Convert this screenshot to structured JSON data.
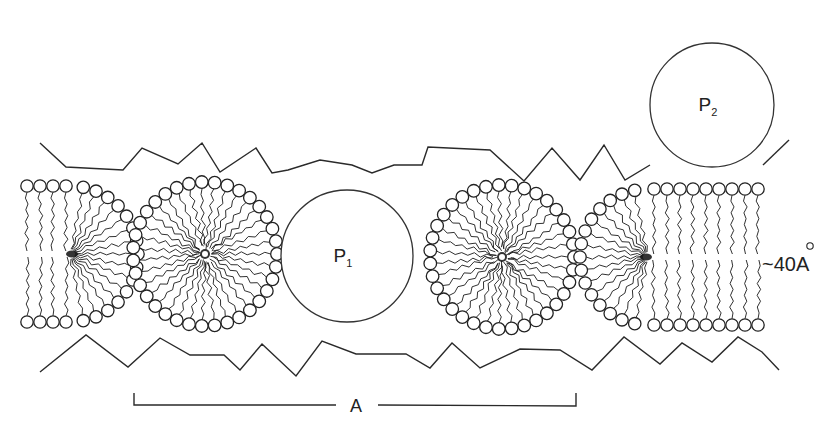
{
  "figure": {
    "labels": {
      "protein_1": "P",
      "protein_1_sub": "1",
      "protein_2": "P",
      "protein_2_sub": "2",
      "thickness": "~40Å",
      "thickness_tilde": "~",
      "thickness_value": "40",
      "thickness_unit": "A",
      "period": "A"
    },
    "colors": {
      "ink": "#222222",
      "background": "#ffffff"
    },
    "elements": {
      "left_half_cylinder": {
        "cx": 70,
        "cy": 254,
        "r": 68
      },
      "micelle_1": {
        "cx": 205,
        "cy": 254,
        "r": 72
      },
      "protein_P1": {
        "cx": 347,
        "cy": 256,
        "r": 66
      },
      "micelle_2": {
        "cx": 502,
        "cy": 257,
        "r": 72
      },
      "right_cylinder": {
        "cx": 648,
        "cy": 257,
        "r": 68,
        "x_end": 758
      },
      "protein_P2": {
        "cx": 712,
        "cy": 105,
        "r": 62
      }
    },
    "zigzag_top": [
      [
        40,
        143
      ],
      [
        66,
        167
      ],
      [
        123,
        170
      ],
      [
        142,
        148
      ],
      [
        178,
        164
      ],
      [
        202,
        143
      ],
      [
        220,
        172
      ],
      [
        256,
        148
      ],
      [
        272,
        173
      ],
      [
        288,
        170
      ],
      [
        320,
        160
      ],
      [
        352,
        165
      ],
      [
        372,
        173
      ],
      [
        394,
        165
      ],
      [
        422,
        165
      ],
      [
        428,
        147
      ],
      [
        490,
        150
      ],
      [
        524,
        181
      ],
      [
        552,
        148
      ],
      [
        580,
        180
      ],
      [
        604,
        145
      ],
      [
        625,
        180
      ],
      [
        650,
        165
      ]
    ],
    "zigzag_top_right": [
      [
        763,
        165
      ],
      [
        789,
        140
      ]
    ],
    "zigzag_bottom": [
      [
        40,
        372
      ],
      [
        86,
        335
      ],
      [
        128,
        367
      ],
      [
        160,
        338
      ],
      [
        190,
        355
      ],
      [
        224,
        355
      ],
      [
        240,
        370
      ],
      [
        262,
        344
      ],
      [
        296,
        376
      ],
      [
        322,
        341
      ],
      [
        356,
        354
      ],
      [
        406,
        354
      ],
      [
        430,
        368
      ],
      [
        452,
        343
      ],
      [
        480,
        368
      ],
      [
        520,
        349
      ],
      [
        560,
        350
      ],
      [
        592,
        370
      ],
      [
        624,
        337
      ],
      [
        660,
        364
      ],
      [
        682,
        343
      ],
      [
        712,
        362
      ],
      [
        738,
        337
      ],
      [
        762,
        352
      ],
      [
        779,
        370
      ]
    ],
    "period_bar": {
      "x1": 134,
      "x2": 576,
      "y": 405,
      "label_x": 356
    }
  }
}
